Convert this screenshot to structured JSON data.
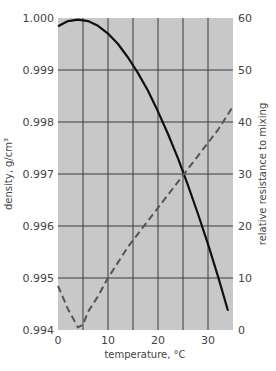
{
  "chart_data": {
    "type": "line",
    "title": "",
    "xlabel": "temperature, °C",
    "ylabel": "density, g/cm³",
    "y2label": "relative resistance to mixing",
    "xlim": [
      0,
      35
    ],
    "ylim": [
      0.994,
      1.0
    ],
    "y2lim": [
      0,
      60
    ],
    "grid": true,
    "x_ticks": [
      "0",
      "10",
      "20",
      "30"
    ],
    "y_ticks": [
      "0.994",
      "0.995",
      "0.996",
      "0.997",
      "0.998",
      "0.999",
      "1.000"
    ],
    "y2_ticks": [
      "0",
      "10",
      "20",
      "30",
      "40",
      "50",
      "60"
    ],
    "series": [
      {
        "name": "density",
        "axis": "left",
        "style": "solid",
        "color": "#111111",
        "x": [
          0,
          2,
          4,
          6,
          8,
          10,
          12,
          14,
          16,
          18,
          20,
          22,
          24,
          26,
          28,
          30,
          32,
          34
        ],
        "y": [
          0.99984,
          0.99994,
          0.99997,
          0.99994,
          0.99985,
          0.9997,
          0.9995,
          0.99924,
          0.99894,
          0.9986,
          0.9982,
          0.99777,
          0.9973,
          0.99678,
          0.99623,
          0.99565,
          0.99503,
          0.99437
        ]
      },
      {
        "name": "relative resistance to mixing",
        "axis": "right",
        "style": "dashed",
        "color": "#555555",
        "x": [
          0,
          2,
          4,
          5,
          6,
          8,
          10,
          12,
          14,
          16,
          18,
          20,
          22,
          24,
          26,
          28,
          30,
          32,
          34,
          35
        ],
        "y": [
          8.5,
          4,
          0.5,
          1,
          3.5,
          6.5,
          10,
          13,
          16,
          18.5,
          21,
          23.5,
          26,
          28.5,
          31,
          33.5,
          36,
          38.5,
          41.5,
          43
        ]
      }
    ]
  },
  "colors": {
    "plot_background": "#c8c8c8",
    "grid": "#3a3a3a"
  }
}
